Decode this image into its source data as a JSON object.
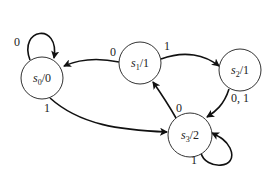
{
  "diagram": {
    "type": "state-machine",
    "states": [
      {
        "id": "s0",
        "name": "s",
        "sub": "0",
        "output": "/0"
      },
      {
        "id": "s1",
        "name": "s",
        "sub": "1",
        "output": "/1"
      },
      {
        "id": "s2",
        "name": "s",
        "sub": "2",
        "output": "/1"
      },
      {
        "id": "s3",
        "name": "s",
        "sub": "3",
        "output": "/2"
      }
    ],
    "transitions": [
      {
        "from": "s0",
        "to": "s0",
        "label": "0"
      },
      {
        "from": "s1",
        "to": "s0",
        "label": "0"
      },
      {
        "from": "s1",
        "to": "s2",
        "label": "1"
      },
      {
        "from": "s0",
        "to": "s3",
        "label": "1"
      },
      {
        "from": "s2",
        "to": "s3",
        "label": "0, 1"
      },
      {
        "from": "s3",
        "to": "s1",
        "label": "0"
      },
      {
        "from": "s3",
        "to": "s3",
        "label": "1"
      }
    ]
  }
}
